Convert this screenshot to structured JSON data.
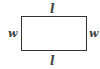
{
  "diagram": {
    "shape": "rectangle",
    "labels": {
      "top": "l",
      "bottom": "l",
      "left": "w",
      "right": "w"
    },
    "colors": {
      "stroke": "#333333",
      "label": "#444444",
      "background": "#ffffff"
    }
  }
}
